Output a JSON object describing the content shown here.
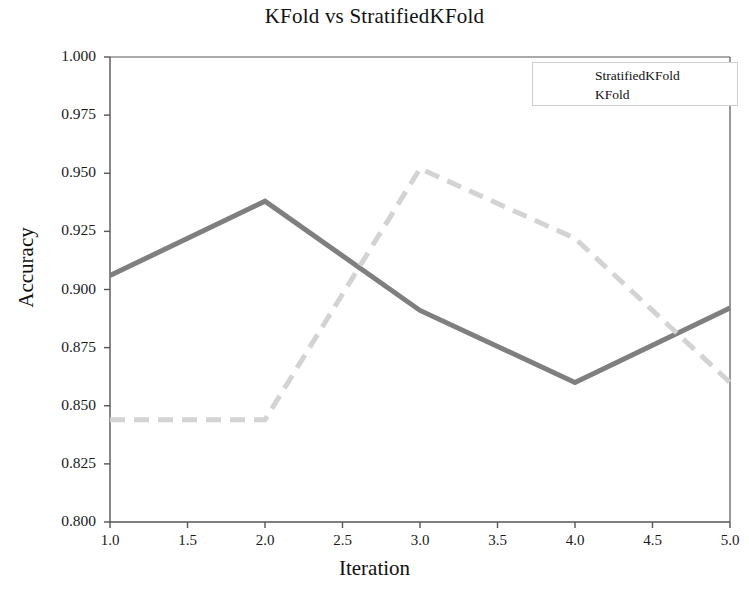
{
  "chart_data": {
    "type": "line",
    "title": "KFold vs StratifiedKFold",
    "xlabel": "Iteration",
    "ylabel": "Accuracy",
    "xlim": [
      1.0,
      5.0
    ],
    "ylim": [
      0.8,
      1.0
    ],
    "grid": false,
    "legend_position": "top-right",
    "x": [
      1.0,
      2.0,
      3.0,
      4.0,
      5.0
    ],
    "xticks": [
      "1.0",
      "1.5",
      "2.0",
      "2.5",
      "3.0",
      "3.5",
      "4.0",
      "4.5",
      "5.0"
    ],
    "xtick_values": [
      1.0,
      1.5,
      2.0,
      2.5,
      3.0,
      3.5,
      4.0,
      4.5,
      5.0
    ],
    "yticks": [
      "0.800",
      "0.825",
      "0.850",
      "0.875",
      "0.900",
      "0.925",
      "0.950",
      "0.975",
      "1.000"
    ],
    "ytick_values": [
      0.8,
      0.825,
      0.85,
      0.875,
      0.9,
      0.925,
      0.95,
      0.975,
      1.0
    ],
    "series": [
      {
        "name": "StratifiedKFold",
        "values": [
          0.906,
          0.938,
          0.891,
          0.86,
          0.892
        ],
        "color": "#7f7f7f",
        "style": "solid",
        "width": 5
      },
      {
        "name": "KFold",
        "values": [
          0.844,
          0.844,
          0.952,
          0.922,
          0.86
        ],
        "color": "#d3d3d3",
        "style": "dashed",
        "width": 5
      }
    ]
  },
  "legend": {
    "entries": [
      {
        "label": "StratifiedKFold"
      },
      {
        "label": "KFold"
      }
    ]
  },
  "axes": {
    "frame_color": "#555555"
  }
}
